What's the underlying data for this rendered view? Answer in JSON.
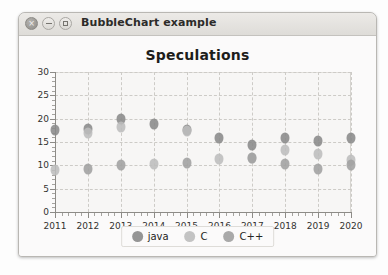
{
  "window": {
    "title": "BubbleChart example",
    "buttons": [
      {
        "name": "close-button",
        "glyph": "×"
      },
      {
        "name": "minimize-button",
        "glyph": "−"
      },
      {
        "name": "maximize-button",
        "glyph": "□"
      }
    ]
  },
  "chart_data": {
    "type": "scatter",
    "title": "Speculations",
    "xlabel": "",
    "ylabel": "",
    "xlim": [
      2011,
      2020
    ],
    "ylim": [
      0,
      30
    ],
    "ytick_step": 5,
    "grid": true,
    "legend_position": "bottom",
    "categories": [
      "2011",
      "2012",
      "2013",
      "2014",
      "2015",
      "2016",
      "2017",
      "2018",
      "2019",
      "2020"
    ],
    "yticks": [
      "0",
      "5",
      "10",
      "15",
      "20",
      "25",
      "30"
    ],
    "colors": {
      "java": "#8a8a8a",
      "C": "#bdbdbd",
      "C++": "#a0a0a0"
    },
    "series": [
      {
        "name": "java",
        "color": "#8a8a8a",
        "points": [
          {
            "x": 2011,
            "y": 17.5,
            "r": 4.5
          },
          {
            "x": 2012,
            "y": 17.8,
            "r": 4.5
          },
          {
            "x": 2013,
            "y": 20.0,
            "r": 4.5
          },
          {
            "x": 2014,
            "y": 18.8,
            "r": 4.5
          },
          {
            "x": 2015,
            "y": 17.5,
            "r": 4.5
          },
          {
            "x": 2016,
            "y": 15.8,
            "r": 4.5
          },
          {
            "x": 2017,
            "y": 14.3,
            "r": 4.5
          },
          {
            "x": 2018,
            "y": 15.9,
            "r": 4.5
          },
          {
            "x": 2019,
            "y": 15.2,
            "r": 4.5
          },
          {
            "x": 2020,
            "y": 15.8,
            "r": 4.5
          }
        ]
      },
      {
        "name": "C",
        "color": "#bdbdbd",
        "points": [
          {
            "x": 2011,
            "y": 9.0,
            "r": 4.5
          },
          {
            "x": 2012,
            "y": 17.0,
            "r": 4.5
          },
          {
            "x": 2013,
            "y": 18.3,
            "r": 4.5
          },
          {
            "x": 2014,
            "y": 10.2,
            "r": 4.5
          },
          {
            "x": 2015,
            "y": 17.3,
            "r": 4.5
          },
          {
            "x": 2016,
            "y": 11.3,
            "r": 4.5
          },
          {
            "x": 2017,
            "y": 11.6,
            "r": 4.5
          },
          {
            "x": 2018,
            "y": 13.2,
            "r": 4.5
          },
          {
            "x": 2019,
            "y": 12.5,
            "r": 4.5
          },
          {
            "x": 2020,
            "y": 11.2,
            "r": 4.5
          }
        ]
      },
      {
        "name": "C++",
        "color": "#a0a0a0",
        "points": [
          {
            "x": 2012,
            "y": 9.3,
            "r": 4.5
          },
          {
            "x": 2013,
            "y": 10.1,
            "r": 4.5
          },
          {
            "x": 2015,
            "y": 10.6,
            "r": 4.5
          },
          {
            "x": 2017,
            "y": 11.6,
            "r": 4.5
          },
          {
            "x": 2018,
            "y": 10.3,
            "r": 4.5
          },
          {
            "x": 2019,
            "y": 9.2,
            "r": 4.5
          },
          {
            "x": 2020,
            "y": 10.0,
            "r": 4.5
          }
        ]
      }
    ],
    "legend": [
      {
        "label": "java",
        "color": "#8a8a8a"
      },
      {
        "label": "C",
        "color": "#bdbdbd"
      },
      {
        "label": "C++",
        "color": "#a0a0a0"
      }
    ]
  }
}
